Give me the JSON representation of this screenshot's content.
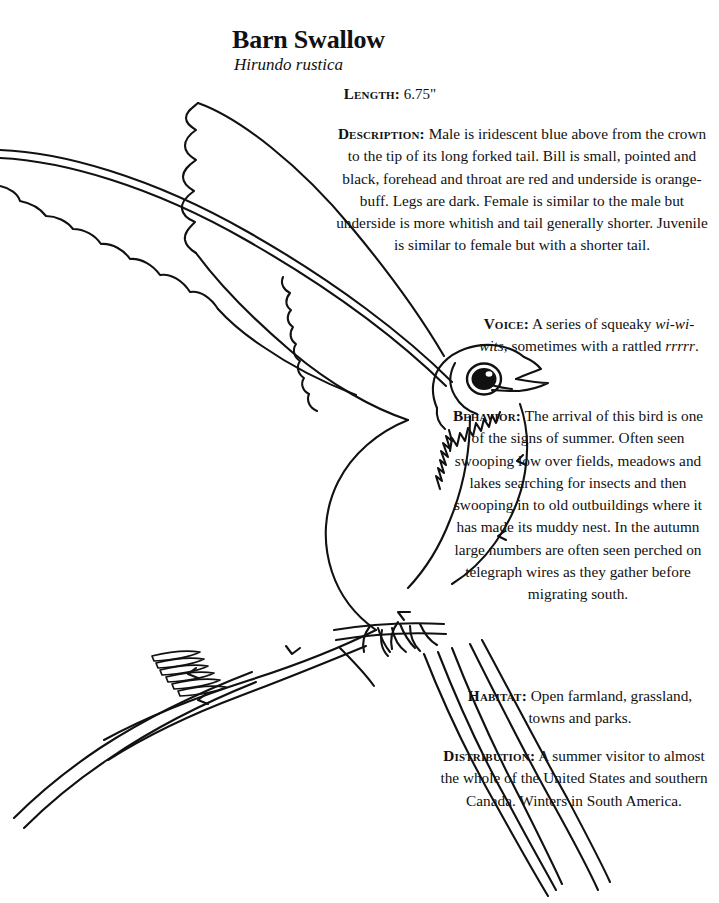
{
  "page": {
    "title": "Barn Swallow",
    "scientific_name": "Hirundo rustica",
    "illustration_name": "barn-swallow-line-drawing"
  },
  "sections": {
    "length": {
      "label": "Length:",
      "text": "6.75\""
    },
    "description": {
      "label": "Description:",
      "text": "Male is iridescent blue above from the crown to the tip of its long forked tail. Bill is small, pointed and black, forehead and throat are red and underside is orange-buff. Legs are dark. Female is similar to the male but underside is more whitish and tail generally shorter. Juvenile is similar to female but with a shorter tail."
    },
    "voice": {
      "label": "Voice:",
      "text_before": "A series of squeaky ",
      "call_1": "wi-wi-wits",
      "text_middle": ", sometimes with a rattled ",
      "call_2": "rrrrr",
      "text_after": "."
    },
    "behavior": {
      "label": "Behavior:",
      "text": "The arrival of this bird is one of the signs of summer. Often seen swooping low over fields, meadows and lakes searching for insects and then swooping in to old outbuildings where it has made its muddy nest. In the autumn large numbers are often seen perched on telegraph wires as they gather before migrating south."
    },
    "habitat": {
      "label": "Habitat:",
      "text": "Open farmland, grassland, towns and parks."
    },
    "distribution": {
      "label": "Distribution:",
      "text": "A summer visitor to almost the whole of the United States and southern Canada. Winters in South America."
    }
  },
  "colors": {
    "ink": "#111111",
    "paper": "#ffffff"
  }
}
